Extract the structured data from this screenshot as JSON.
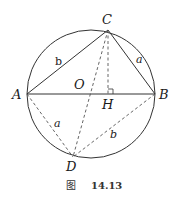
{
  "figure": {
    "caption_prefix": "图",
    "caption_number": "14.13"
  },
  "points": {
    "A": {
      "label": "A",
      "x": 27,
      "y": 94
    },
    "B": {
      "label": "B",
      "x": 155,
      "y": 94
    },
    "C": {
      "label": "C",
      "x": 108,
      "y": 30
    },
    "D": {
      "label": "D",
      "x": 73,
      "y": 157
    },
    "O": {
      "label": "O",
      "x": 91,
      "y": 94
    },
    "H": {
      "label": "H",
      "x": 108,
      "y": 94
    }
  },
  "circle": {
    "cx": 91,
    "cy": 94,
    "r": 64
  },
  "side_labels": {
    "AC": "b",
    "BC": "a",
    "AD": "a",
    "BD": "b"
  },
  "colors": {
    "stroke": "#333333",
    "dashed": "#555555",
    "text": "#1a1a1a"
  }
}
